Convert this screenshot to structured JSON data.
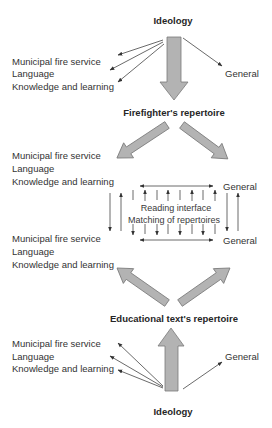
{
  "diagram": {
    "top_heading": "Ideology",
    "firefighter_heading": "Firefighter's repertoire",
    "educational_heading": "Educational text's repertoire",
    "bottom_heading": "Ideology",
    "interface": {
      "line1": "Reading interface",
      "line2": "Matching of repertoires"
    },
    "sections": [
      {
        "items": [
          "Municipal fire service",
          "Language",
          "Knowledge and learning"
        ],
        "general": "General"
      },
      {
        "items": [
          "Municipal fire service",
          "Language",
          "Knowledge and learning"
        ],
        "general": "General"
      },
      {
        "items": [
          "Municipal fire service",
          "Language",
          "Knowledge and learning"
        ],
        "general": "General"
      },
      {
        "items": [
          "Municipal fire service",
          "Language",
          "Knowledge and learning"
        ],
        "general": "General"
      }
    ]
  },
  "colors": {
    "text": "#333333",
    "thin_arrow": "#444444",
    "block_arrow_fill": "#b3b3b3",
    "block_arrow_stroke": "#7a7a7a",
    "background": "#ffffff"
  }
}
